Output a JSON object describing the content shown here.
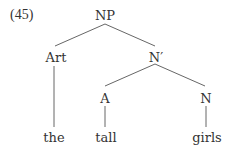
{
  "example_number": "(45)",
  "tree": {
    "root": {
      "label": "NP"
    },
    "art": {
      "label": "Art",
      "word": "the"
    },
    "nbar": {
      "label": "N′"
    },
    "adj": {
      "label": "A",
      "word": "tall"
    },
    "noun": {
      "label": "N",
      "word": "girls"
    }
  },
  "colors": {
    "text": "#333333",
    "lines": "#555555",
    "background": "#ffffff"
  }
}
